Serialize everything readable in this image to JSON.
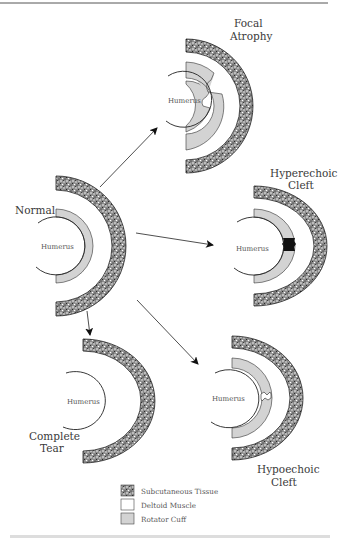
{
  "figure": {
    "colors": {
      "subcutaneous_fill": "#7a7a7a",
      "rotator_cuff_fill": "#d3d3d3",
      "deltoid_fill": "#ffffff",
      "line": "#222222"
    },
    "panels": [
      {
        "id": "normal",
        "title_lines": [
          "Normal"
        ],
        "bone_label": "Humerus"
      },
      {
        "id": "focal-atrophy",
        "title_lines": [
          "Focal",
          "Atrophy"
        ],
        "bone_label": "Humerus"
      },
      {
        "id": "hyperechoic-cleft",
        "title_lines": [
          "Hyperechoic",
          "Cleft"
        ],
        "bone_label": "Humerus"
      },
      {
        "id": "complete-tear",
        "title_lines": [
          "Complete",
          "Tear"
        ],
        "bone_label": "Humerus"
      },
      {
        "id": "hypoechoic-cleft",
        "title_lines": [
          "Hypoechoic",
          "Cleft"
        ],
        "bone_label": "Humerus"
      }
    ],
    "legend": [
      {
        "label": "Subcutaneous Tissue",
        "swatch": "stipple"
      },
      {
        "label": "Deltoid Muscle",
        "swatch": "white"
      },
      {
        "label": "Rotator Cuff",
        "swatch": "gray"
      }
    ],
    "arrows": [
      {
        "from": "normal",
        "to": "focal-atrophy"
      },
      {
        "from": "normal",
        "to": "hyperechoic-cleft"
      },
      {
        "from": "normal",
        "to": "complete-tear"
      },
      {
        "from": "normal",
        "to": "hypoechoic-cleft"
      }
    ]
  }
}
